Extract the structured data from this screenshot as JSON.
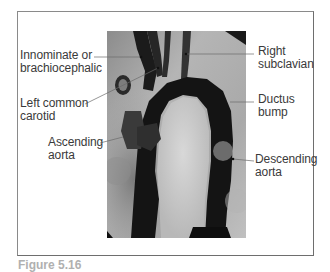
{
  "figure": {
    "type": "aortogram",
    "labels": {
      "innominate": [
        "Innominate or",
        "brachiocephalic"
      ],
      "left_common_carotid": [
        "Left common",
        "carotid"
      ],
      "ascending_aorta": [
        "Ascending",
        "aorta"
      ],
      "right_subclavian": [
        "Right",
        "subclavian"
      ],
      "ductus_bump": [
        "Ductus",
        "bump"
      ],
      "descending_aorta": [
        "Descending",
        "aorta"
      ]
    },
    "caption": "Figure 5.16"
  },
  "colors": {
    "frame": "#8a8a8a",
    "text": "#3a3a3a",
    "leader": "#6a6a6a",
    "vessel": "#111111",
    "background_tissue": "#a8a8a8"
  }
}
